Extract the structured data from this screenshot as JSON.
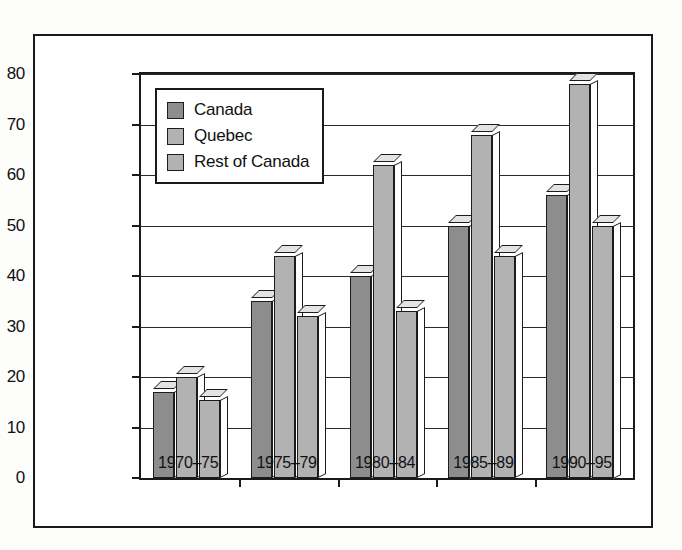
{
  "chart_data": {
    "type": "bar",
    "title": "",
    "xlabel": "",
    "ylabel": "Percentage of First Unions",
    "categories": [
      "1970–75",
      "1975–79",
      "1980–84",
      "1985–89",
      "1990–95"
    ],
    "series": [
      {
        "name": "Canada",
        "color": "#8d8d8d",
        "values": [
          17,
          35,
          40,
          50,
          56
        ]
      },
      {
        "name": "Quebec",
        "color": "#b2b2b2",
        "values": [
          20,
          44,
          62,
          68,
          78
        ]
      },
      {
        "name": "Rest of Canada",
        "color": "#b2b2b2",
        "values": [
          15.5,
          32,
          33,
          44,
          50
        ]
      }
    ],
    "ylim": [
      0,
      80
    ],
    "yticks": [
      0,
      10,
      20,
      30,
      40,
      50,
      60,
      70,
      80
    ],
    "ytick_labels": [
      "0",
      "10",
      "20",
      "30",
      "40",
      "50",
      "60",
      "70",
      "80"
    ],
    "grid": true,
    "legend_position": "top-left",
    "legend_entries": [
      "Canada",
      "Quebec",
      "Rest of Canada"
    ],
    "style": "3d-columns",
    "border_color": "#1a1a1a"
  }
}
